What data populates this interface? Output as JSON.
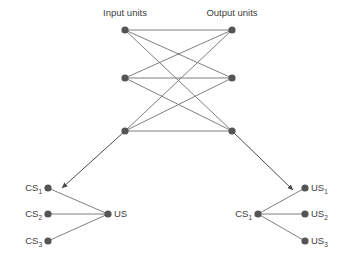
{
  "figure": {
    "background_color": "#ffffff",
    "node_color": "#555555",
    "edge_color": "#707070",
    "text_color": "#3d3d3d",
    "headers": {
      "input_units": "Input units",
      "output_units": "Output units"
    },
    "network": {
      "input_nodes": [
        {
          "id": "input-1",
          "x": 125,
          "y": 30
        },
        {
          "id": "input-2",
          "x": 125,
          "y": 78
        },
        {
          "id": "input-3",
          "x": 125,
          "y": 131
        }
      ],
      "output_nodes": [
        {
          "id": "output-1",
          "x": 232,
          "y": 30
        },
        {
          "id": "output-2",
          "x": 232,
          "y": 78
        },
        {
          "id": "output-3",
          "x": 232,
          "y": 131
        }
      ],
      "edges": [
        {
          "from": "input-1",
          "to": "output-1"
        },
        {
          "from": "input-1",
          "to": "output-2"
        },
        {
          "from": "input-1",
          "to": "output-3"
        },
        {
          "from": "input-2",
          "to": "output-1"
        },
        {
          "from": "input-2",
          "to": "output-2"
        },
        {
          "from": "input-2",
          "to": "output-3"
        },
        {
          "from": "input-3",
          "to": "output-1"
        },
        {
          "from": "input-3",
          "to": "output-2"
        },
        {
          "from": "input-3",
          "to": "output-3"
        }
      ]
    },
    "left_cluster": {
      "hub": {
        "id": "left-hub",
        "label": "US",
        "sub": "",
        "x": 108,
        "y": 214
      },
      "leaves": [
        {
          "id": "left-cs-1",
          "label": "CS",
          "sub": "1",
          "x": 48,
          "y": 188
        },
        {
          "id": "left-cs-2",
          "label": "CS",
          "sub": "2",
          "x": 48,
          "y": 214
        },
        {
          "id": "left-cs-3",
          "label": "CS",
          "sub": "3",
          "x": 48,
          "y": 241
        }
      ]
    },
    "right_cluster": {
      "hub": {
        "id": "right-hub",
        "label": "CS",
        "sub": "1",
        "x": 258,
        "y": 214
      },
      "leaves": [
        {
          "id": "right-us-1",
          "label": "US",
          "sub": "1",
          "x": 305,
          "y": 188
        },
        {
          "id": "right-us-2",
          "label": "US",
          "sub": "2",
          "x": 305,
          "y": 214
        },
        {
          "id": "right-us-3",
          "label": "US",
          "sub": "3",
          "x": 305,
          "y": 241
        }
      ]
    },
    "arrows": [
      {
        "id": "arrow-left",
        "x1": 125,
        "y1": 131,
        "x2": 62,
        "y2": 188
      },
      {
        "id": "arrow-right",
        "x1": 232,
        "y1": 131,
        "x2": 293,
        "y2": 190
      }
    ]
  }
}
